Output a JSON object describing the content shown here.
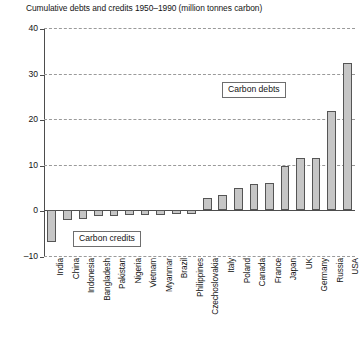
{
  "chart_data": {
    "type": "bar",
    "title": "Cumulative debts and credits 1950–1990 (million tonnes carbon)",
    "xlabel": "",
    "ylabel": "",
    "ylim": [
      -10,
      40
    ],
    "yticks": [
      -10,
      0,
      10,
      20,
      30,
      40
    ],
    "ytick_labels": [
      "–10",
      "0",
      "10",
      "20",
      "30",
      "40"
    ],
    "grid": "horizontal-dashed",
    "legend": "none",
    "categories": [
      "India",
      "China",
      "Indonesia",
      "Bangladesh",
      "Pakistan",
      "Nigeria",
      "Vietnam",
      "Myanmar",
      "Brazil",
      "Philippines",
      "Czechoslovakia",
      "Italy",
      "Poland",
      "Canada",
      "France",
      "Japan",
      "UK",
      "Germany",
      "Russia",
      "USA"
    ],
    "values": [
      -7.0,
      -2.2,
      -1.8,
      -1.3,
      -1.2,
      -1.1,
      -1.0,
      -1.0,
      -0.8,
      -0.7,
      2.8,
      3.3,
      5.0,
      5.7,
      6.0,
      9.8,
      11.4,
      11.5,
      21.8,
      32.3
    ],
    "annotations": [
      {
        "text": "Carbon debts",
        "name": "carbon-debts-annotation"
      },
      {
        "text": "Carbon credits",
        "name": "carbon-credits-annotation"
      }
    ],
    "colors": {
      "bar_fill": "#c6c6c6",
      "bar_edge": "#555555",
      "axis": "#4d4d4d",
      "grid": "#9a9a9a",
      "text": "#141414",
      "background": "#ffffff"
    }
  }
}
